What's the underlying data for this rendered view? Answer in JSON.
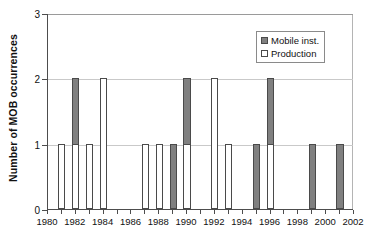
{
  "chart_data": {
    "type": "bar",
    "stacked": true,
    "title": "",
    "subtitle": "",
    "xlabel": "",
    "ylabel": "Number of MOB occurrences",
    "xlim": [
      1980,
      2002
    ],
    "ylim": [
      0,
      3
    ],
    "y_ticks": [
      0,
      1,
      2,
      3
    ],
    "y_tick_labels": [
      "0",
      "1",
      "2",
      "3"
    ],
    "x_ticks": [
      1980,
      1981,
      1982,
      1983,
      1984,
      1985,
      1986,
      1987,
      1988,
      1989,
      1990,
      1991,
      1992,
      1993,
      1994,
      1995,
      1996,
      1997,
      1998,
      1999,
      2000,
      2001,
      2002
    ],
    "x_tick_labels": [
      "1980",
      "1982",
      "1984",
      "1986",
      "1988",
      "1990",
      "1992",
      "1994",
      "1996",
      "1998",
      "2000",
      "2002"
    ],
    "x_tick_label_values": [
      1980,
      1982,
      1984,
      1986,
      1988,
      1990,
      1992,
      1994,
      1996,
      1998,
      2000,
      2002
    ],
    "grid": "horizontal",
    "legend_position": "top-right",
    "categories": [
      1980,
      1981,
      1982,
      1983,
      1984,
      1985,
      1986,
      1987,
      1988,
      1989,
      1990,
      1991,
      1992,
      1993,
      1994,
      1995,
      1996,
      1997,
      1998,
      1999,
      2000,
      2001,
      2002
    ],
    "series": [
      {
        "name": "Production",
        "color": "#ffffff",
        "values": [
          0,
          1,
          1,
          1,
          2,
          0,
          0,
          1,
          1,
          0,
          1,
          0,
          2,
          1,
          0,
          0,
          1,
          0,
          0,
          0,
          0,
          0,
          0
        ]
      },
      {
        "name": "Mobile inst.",
        "color": "#808080",
        "values": [
          0,
          0,
          1,
          0,
          0,
          0,
          0,
          0,
          0,
          1,
          1,
          0,
          0,
          0,
          0,
          1,
          1,
          0,
          0,
          1,
          0,
          1,
          0
        ]
      }
    ],
    "totals": [
      0,
      1,
      2,
      1,
      2,
      0,
      0,
      1,
      1,
      1,
      2,
      0,
      2,
      1,
      0,
      1,
      2,
      0,
      0,
      1,
      0,
      1,
      0
    ]
  },
  "legend": {
    "items": [
      {
        "label": "Mobile inst.",
        "swatch": "mobile"
      },
      {
        "label": "Production",
        "swatch": "production"
      }
    ]
  },
  "axes": {
    "y_title": "Number of MOB occurrences"
  }
}
